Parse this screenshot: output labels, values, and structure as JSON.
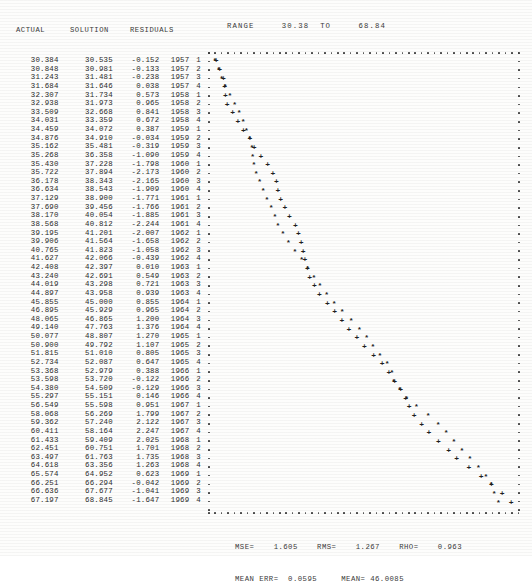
{
  "table": {
    "headers": {
      "actual": "ACTUAL",
      "solution": "SOLUTION",
      "residuals": "RESIDUALS"
    },
    "rows": [
      {
        "actual": "30.384",
        "solution": "30.535",
        "residual": "-0.152",
        "year": "1957",
        "quarter": "1"
      },
      {
        "actual": "30.848",
        "solution": "30.981",
        "residual": "-0.133",
        "year": "1957",
        "quarter": "2"
      },
      {
        "actual": "31.243",
        "solution": "31.481",
        "residual": "-0.238",
        "year": "1957",
        "quarter": "3"
      },
      {
        "actual": "31.684",
        "solution": "31.646",
        "residual": "0.038",
        "year": "1957",
        "quarter": "4"
      },
      {
        "actual": "32.307",
        "solution": "31.734",
        "residual": "0.573",
        "year": "1958",
        "quarter": "1"
      },
      {
        "actual": "32.938",
        "solution": "31.973",
        "residual": "0.965",
        "year": "1958",
        "quarter": "2"
      },
      {
        "actual": "33.509",
        "solution": "32.668",
        "residual": "0.841",
        "year": "1958",
        "quarter": "3"
      },
      {
        "actual": "34.031",
        "solution": "33.359",
        "residual": "0.672",
        "year": "1958",
        "quarter": "4"
      },
      {
        "actual": "34.459",
        "solution": "34.072",
        "residual": "0.387",
        "year": "1959",
        "quarter": "1"
      },
      {
        "actual": "34.876",
        "solution": "34.910",
        "residual": "-0.034",
        "year": "1959",
        "quarter": "2"
      },
      {
        "actual": "35.162",
        "solution": "35.481",
        "residual": "-0.319",
        "year": "1959",
        "quarter": "3"
      },
      {
        "actual": "35.268",
        "solution": "36.358",
        "residual": "-1.090",
        "year": "1959",
        "quarter": "4"
      },
      {
        "actual": "35.430",
        "solution": "37.228",
        "residual": "-1.798",
        "year": "1960",
        "quarter": "1"
      },
      {
        "actual": "35.722",
        "solution": "37.894",
        "residual": "-2.173",
        "year": "1960",
        "quarter": "2"
      },
      {
        "actual": "36.178",
        "solution": "38.343",
        "residual": "-2.165",
        "year": "1960",
        "quarter": "3"
      },
      {
        "actual": "36.634",
        "solution": "38.543",
        "residual": "-1.909",
        "year": "1960",
        "quarter": "4"
      },
      {
        "actual": "37.129",
        "solution": "38.900",
        "residual": "-1.771",
        "year": "1961",
        "quarter": "1"
      },
      {
        "actual": "37.690",
        "solution": "39.456",
        "residual": "-1.766",
        "year": "1961",
        "quarter": "2"
      },
      {
        "actual": "38.170",
        "solution": "40.054",
        "residual": "-1.885",
        "year": "1961",
        "quarter": "3"
      },
      {
        "actual": "38.568",
        "solution": "40.812",
        "residual": "-2.244",
        "year": "1961",
        "quarter": "4"
      },
      {
        "actual": "39.195",
        "solution": "41.201",
        "residual": "-2.007",
        "year": "1962",
        "quarter": "1"
      },
      {
        "actual": "39.906",
        "solution": "41.564",
        "residual": "-1.658",
        "year": "1962",
        "quarter": "2"
      },
      {
        "actual": "40.765",
        "solution": "41.823",
        "residual": "-1.058",
        "year": "1962",
        "quarter": "3"
      },
      {
        "actual": "41.627",
        "solution": "42.066",
        "residual": "-0.439",
        "year": "1962",
        "quarter": "4"
      },
      {
        "actual": "42.408",
        "solution": "42.397",
        "residual": "0.010",
        "year": "1963",
        "quarter": "1"
      },
      {
        "actual": "43.240",
        "solution": "42.691",
        "residual": "0.549",
        "year": "1963",
        "quarter": "2"
      },
      {
        "actual": "44.019",
        "solution": "43.298",
        "residual": "0.721",
        "year": "1963",
        "quarter": "3"
      },
      {
        "actual": "44.897",
        "solution": "43.958",
        "residual": "0.939",
        "year": "1963",
        "quarter": "4"
      },
      {
        "actual": "45.855",
        "solution": "45.000",
        "residual": "0.855",
        "year": "1964",
        "quarter": "1"
      },
      {
        "actual": "46.895",
        "solution": "45.929",
        "residual": "0.965",
        "year": "1964",
        "quarter": "2"
      },
      {
        "actual": "48.065",
        "solution": "46.865",
        "residual": "1.200",
        "year": "1964",
        "quarter": "3"
      },
      {
        "actual": "49.140",
        "solution": "47.763",
        "residual": "1.376",
        "year": "1964",
        "quarter": "4"
      },
      {
        "actual": "50.077",
        "solution": "48.807",
        "residual": "1.270",
        "year": "1965",
        "quarter": "1"
      },
      {
        "actual": "50.900",
        "solution": "49.792",
        "residual": "1.107",
        "year": "1965",
        "quarter": "2"
      },
      {
        "actual": "51.815",
        "solution": "51.010",
        "residual": "0.805",
        "year": "1965",
        "quarter": "3"
      },
      {
        "actual": "52.734",
        "solution": "52.087",
        "residual": "0.647",
        "year": "1965",
        "quarter": "4"
      },
      {
        "actual": "53.368",
        "solution": "52.979",
        "residual": "0.388",
        "year": "1966",
        "quarter": "1"
      },
      {
        "actual": "53.598",
        "solution": "53.720",
        "residual": "-0.122",
        "year": "1966",
        "quarter": "2"
      },
      {
        "actual": "54.380",
        "solution": "54.509",
        "residual": "-0.129",
        "year": "1966",
        "quarter": "3"
      },
      {
        "actual": "55.297",
        "solution": "55.151",
        "residual": "0.146",
        "year": "1966",
        "quarter": "4"
      },
      {
        "actual": "56.549",
        "solution": "55.598",
        "residual": "0.951",
        "year": "1967",
        "quarter": "1"
      },
      {
        "actual": "58.068",
        "solution": "56.269",
        "residual": "1.799",
        "year": "1967",
        "quarter": "2"
      },
      {
        "actual": "59.362",
        "solution": "57.240",
        "residual": "2.122",
        "year": "1967",
        "quarter": "3"
      },
      {
        "actual": "60.411",
        "solution": "58.164",
        "residual": "2.247",
        "year": "1967",
        "quarter": "4"
      },
      {
        "actual": "61.433",
        "solution": "59.409",
        "residual": "2.025",
        "year": "1968",
        "quarter": "1"
      },
      {
        "actual": "62.451",
        "solution": "60.751",
        "residual": "1.701",
        "year": "1968",
        "quarter": "2"
      },
      {
        "actual": "63.497",
        "solution": "61.763",
        "residual": "1.735",
        "year": "1968",
        "quarter": "3"
      },
      {
        "actual": "64.618",
        "solution": "63.356",
        "residual": "1.263",
        "year": "1968",
        "quarter": "4"
      },
      {
        "actual": "65.574",
        "solution": "64.952",
        "residual": "0.623",
        "year": "1969",
        "quarter": "1"
      },
      {
        "actual": "66.251",
        "solution": "66.294",
        "residual": "-0.042",
        "year": "1969",
        "quarter": "2"
      },
      {
        "actual": "66.636",
        "solution": "67.677",
        "residual": "-1.041",
        "year": "1969",
        "quarter": "3"
      },
      {
        "actual": "67.197",
        "solution": "68.845",
        "residual": "-1.647",
        "year": "1969",
        "quarter": "4"
      }
    ]
  },
  "plot": {
    "range_label": "RANGE     30.38  TO     68.84",
    "range_min": 30.38,
    "range_max": 68.84,
    "actual_marker": "*",
    "solution_marker": "+"
  },
  "stats": {
    "line1": "MSE=    1.605    RMS=    1.267    RHO=    0.963",
    "line2": "MEAN ERR=  0.0595     MEAN= 46.0085",
    "mse": "1.605",
    "rms": "1.267",
    "rho": "0.963",
    "mean_err": "0.0595",
    "mean": "46.0085"
  },
  "chart_data": {
    "type": "scatter",
    "title": "RANGE     30.38  TO     68.84",
    "xlabel": "",
    "ylabel": "",
    "orientation": "transposed-rows-down-value-across",
    "xlim": [
      30.38,
      68.84
    ],
    "grid": false,
    "legend": [
      "ACTUAL (*)",
      "SOLUTION (+)"
    ],
    "categories": [
      "1957 1",
      "1957 2",
      "1957 3",
      "1957 4",
      "1958 1",
      "1958 2",
      "1958 3",
      "1958 4",
      "1959 1",
      "1959 2",
      "1959 3",
      "1959 4",
      "1960 1",
      "1960 2",
      "1960 3",
      "1960 4",
      "1961 1",
      "1961 2",
      "1961 3",
      "1961 4",
      "1962 1",
      "1962 2",
      "1962 3",
      "1962 4",
      "1963 1",
      "1963 2",
      "1963 3",
      "1963 4",
      "1964 1",
      "1964 2",
      "1964 3",
      "1964 4",
      "1965 1",
      "1965 2",
      "1965 3",
      "1965 4",
      "1966 1",
      "1966 2",
      "1966 3",
      "1966 4",
      "1967 1",
      "1967 2",
      "1967 3",
      "1967 4",
      "1968 1",
      "1968 2",
      "1968 3",
      "1968 4",
      "1969 1",
      "1969 2",
      "1969 3",
      "1969 4"
    ],
    "series": [
      {
        "name": "ACTUAL",
        "marker": "*",
        "values": [
          30.384,
          30.848,
          31.243,
          31.684,
          32.307,
          32.938,
          33.509,
          34.031,
          34.459,
          34.876,
          35.162,
          35.268,
          35.43,
          35.722,
          36.178,
          36.634,
          37.129,
          37.69,
          38.17,
          38.568,
          39.195,
          39.906,
          40.765,
          41.627,
          42.408,
          43.24,
          44.019,
          44.897,
          45.855,
          46.895,
          48.065,
          49.14,
          50.077,
          50.9,
          51.815,
          52.734,
          53.368,
          53.598,
          54.38,
          55.297,
          56.549,
          58.068,
          59.362,
          60.411,
          61.433,
          62.451,
          63.497,
          64.618,
          65.574,
          66.251,
          66.636,
          67.197
        ]
      },
      {
        "name": "SOLUTION",
        "marker": "+",
        "values": [
          30.535,
          30.981,
          31.481,
          31.646,
          31.734,
          31.973,
          32.668,
          33.359,
          34.072,
          34.91,
          35.481,
          36.358,
          37.228,
          37.894,
          38.343,
          38.543,
          38.9,
          39.456,
          40.054,
          40.812,
          41.201,
          41.564,
          41.823,
          42.066,
          42.397,
          42.691,
          43.298,
          43.958,
          45.0,
          45.929,
          46.865,
          47.763,
          48.807,
          49.792,
          51.01,
          52.087,
          52.979,
          53.72,
          54.509,
          55.151,
          55.598,
          56.269,
          57.24,
          58.164,
          59.409,
          60.751,
          61.763,
          63.356,
          64.952,
          66.294,
          67.677,
          68.845
        ]
      },
      {
        "name": "RESIDUALS",
        "marker": "",
        "values": [
          -0.152,
          -0.133,
          -0.238,
          0.038,
          0.573,
          0.965,
          0.841,
          0.672,
          0.387,
          -0.034,
          -0.319,
          -1.09,
          -1.798,
          -2.173,
          -2.165,
          -1.909,
          -1.771,
          -1.766,
          -1.885,
          -2.244,
          -2.007,
          -1.658,
          -1.058,
          -0.439,
          0.01,
          0.549,
          0.721,
          0.939,
          0.855,
          0.965,
          1.2,
          1.376,
          1.27,
          1.107,
          0.805,
          0.647,
          0.388,
          -0.122,
          -0.129,
          0.146,
          0.951,
          1.799,
          2.122,
          2.247,
          2.025,
          1.701,
          1.735,
          1.263,
          0.623,
          -0.042,
          -1.041,
          -1.647
        ]
      }
    ],
    "annotations": [
      "MSE= 1.605",
      "RMS= 1.267",
      "RHO= 0.963",
      "MEAN ERR= 0.0595",
      "MEAN= 46.0085"
    ]
  }
}
